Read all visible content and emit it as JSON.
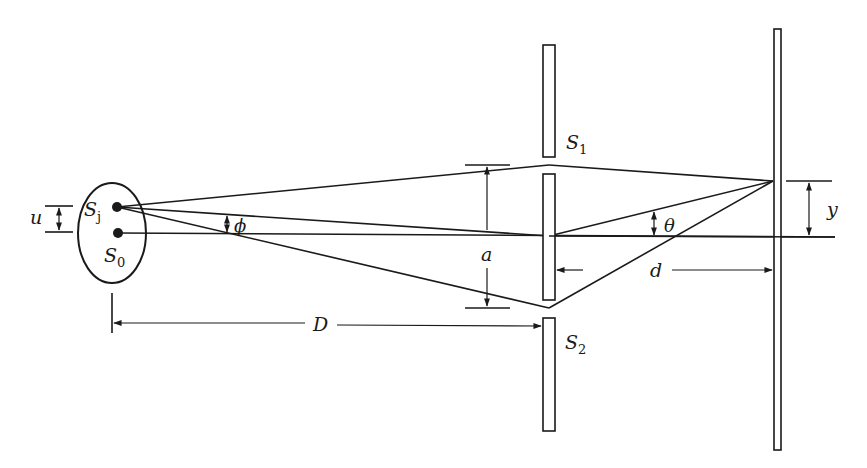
{
  "diagram": {
    "type": "double-slit interference with extended source",
    "colors": {
      "ink": "#1a1a1a",
      "background": "#ffffff"
    },
    "source": {
      "shape": "ellipse",
      "points": [
        {
          "id": "Sj",
          "label": "S",
          "subscript": "j"
        },
        {
          "id": "S0",
          "label": "S",
          "subscript": "0"
        }
      ]
    },
    "slits": [
      {
        "id": "S1",
        "label": "S",
        "subscript": "1"
      },
      {
        "id": "S2",
        "label": "S",
        "subscript": "2"
      }
    ],
    "labels": {
      "u": "u",
      "phi": "ϕ",
      "a": "a",
      "theta": "θ",
      "y": "y",
      "d": "d",
      "D": "D"
    },
    "dimensions": [
      {
        "label": "u",
        "meaning": "separation between source points Sj and S0"
      },
      {
        "label": "a",
        "meaning": "separation between slits S1 and S2"
      },
      {
        "label": "D",
        "meaning": "source to slit screen distance"
      },
      {
        "label": "d",
        "meaning": "slit screen to observation screen distance"
      },
      {
        "label": "y",
        "meaning": "height of observation point on screen"
      }
    ],
    "angles": [
      {
        "label": "ϕ",
        "meaning": "angle of source point Sj from axis"
      },
      {
        "label": "θ",
        "meaning": "angle of observation point from axis"
      }
    ]
  }
}
